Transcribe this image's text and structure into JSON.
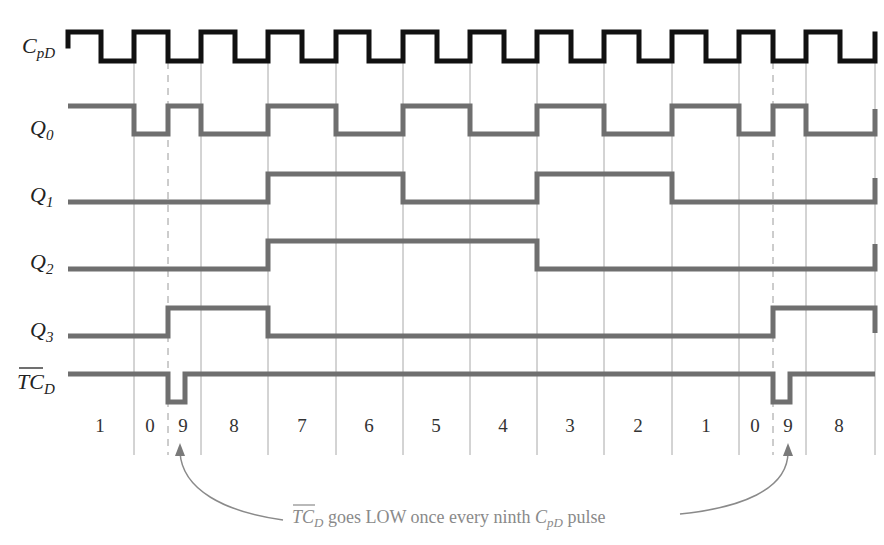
{
  "diagram": {
    "type": "timing-diagram",
    "signals": [
      {
        "id": "clk",
        "label_main": "C",
        "label_sub": "pD",
        "overbar": false
      },
      {
        "id": "q0",
        "label_main": "Q",
        "label_sub": "0",
        "overbar": false
      },
      {
        "id": "q1",
        "label_main": "Q",
        "label_sub": "1",
        "overbar": false
      },
      {
        "id": "q2",
        "label_main": "Q",
        "label_sub": "2",
        "overbar": false
      },
      {
        "id": "q3",
        "label_main": "Q",
        "label_sub": "3",
        "overbar": false
      },
      {
        "id": "tcd",
        "label_main": "TC",
        "label_sub": "D",
        "overbar": true
      }
    ],
    "count_sequence": [
      "1",
      "0",
      "9",
      "8",
      "7",
      "6",
      "5",
      "4",
      "3",
      "2",
      "1",
      "0",
      "9",
      "8"
    ],
    "annotation": {
      "prefix_main": "TC",
      "prefix_sub": "D",
      "middle": " goes LOW once every ninth ",
      "clk_main": "C",
      "clk_sub": "pD",
      "suffix": " pulse"
    },
    "colors": {
      "clock": "#111111",
      "waveform": "#6f6f6f",
      "gridline": "#a8a8a8",
      "annotation": "#8a8a8a"
    }
  }
}
